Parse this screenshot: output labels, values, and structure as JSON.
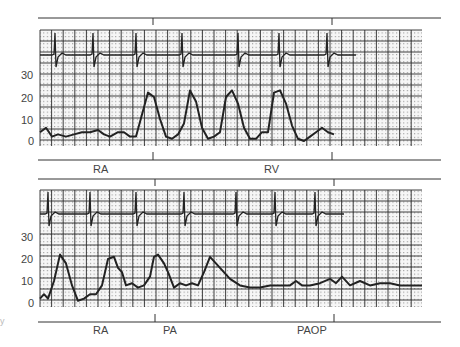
{
  "figure": {
    "stray_mark": "y",
    "grid_colors": {
      "major": "#1a1a1a",
      "minor": "#8a8a8a",
      "trace": "#222222",
      "paper": "#f4f4f4"
    }
  },
  "chart_data": [
    {
      "type": "line",
      "title": "",
      "panel": "top",
      "ylabel": "mmHg",
      "xlabel": "",
      "ylim": [
        0,
        40
      ],
      "yticks": [
        0,
        10,
        20,
        30
      ],
      "grid": true,
      "segment_labels": [
        "RA",
        "RV"
      ],
      "segment_boundaries_px": [
        153,
        332
      ],
      "series": [
        {
          "name": "ECG",
          "description": "ECG rhythm strip with QRS complexes",
          "qrs_x_px": [
            56,
            94,
            137,
            183,
            239,
            280,
            328
          ]
        },
        {
          "name": "Pressure",
          "description": "RA pressure waveform transitioning to RV pressure waveform",
          "x_px": [
            40,
            46,
            52,
            58,
            66,
            74,
            82,
            90,
            98,
            104,
            110,
            118,
            124,
            130,
            136,
            142,
            148,
            154,
            160,
            166,
            172,
            178,
            184,
            190,
            196,
            202,
            208,
            214,
            220,
            226,
            232,
            238,
            244,
            250,
            256,
            262,
            268,
            274,
            280,
            286,
            292,
            298,
            304,
            310,
            316,
            322,
            328,
            334
          ],
          "values": [
            4,
            6,
            2,
            3,
            2,
            3,
            4,
            4,
            5,
            3,
            2,
            4,
            4,
            2,
            2,
            12,
            22,
            20,
            10,
            2,
            1,
            3,
            8,
            23,
            18,
            6,
            1,
            2,
            4,
            20,
            23,
            17,
            6,
            1,
            1,
            4,
            4,
            22,
            23,
            17,
            7,
            1,
            0,
            2,
            4,
            6,
            4,
            3
          ]
        }
      ]
    },
    {
      "type": "line",
      "title": "",
      "panel": "bottom",
      "ylabel": "mmHg",
      "xlabel": "",
      "ylim": [
        0,
        40
      ],
      "yticks": [
        0,
        10,
        20,
        30
      ],
      "grid": true,
      "segment_labels": [
        "RA",
        "PA",
        "PAOP"
      ],
      "segment_boundaries_px": [
        155,
        334
      ],
      "series": [
        {
          "name": "ECG",
          "description": "ECG rhythm strip with QRS complexes",
          "qrs_x_px": [
            49,
            91,
            137,
            185,
            237,
            276,
            316
          ]
        },
        {
          "name": "Pressure",
          "description": "RV/PA pressure waveform transitioning to PAOP",
          "x_px": [
            40,
            44,
            48,
            54,
            60,
            66,
            72,
            78,
            84,
            90,
            96,
            102,
            108,
            114,
            118,
            122,
            126,
            132,
            138,
            144,
            150,
            154,
            158,
            164,
            168,
            174,
            180,
            186,
            192,
            198,
            204,
            210,
            220,
            230,
            240,
            250,
            260,
            270,
            280,
            290,
            296,
            302,
            310,
            320,
            330,
            336,
            342,
            350,
            360,
            370,
            380,
            390,
            400,
            410,
            422
          ],
          "values": [
            2,
            4,
            2,
            10,
            22,
            18,
            8,
            1,
            2,
            4,
            4,
            8,
            20,
            21,
            16,
            14,
            8,
            9,
            7,
            8,
            12,
            21,
            22,
            18,
            14,
            7,
            9,
            8,
            9,
            8,
            14,
            21,
            16,
            11,
            8,
            7,
            7,
            8,
            8,
            8,
            10,
            8,
            8,
            9,
            11,
            9,
            12,
            8,
            10,
            8,
            9,
            9,
            8,
            8,
            8
          ]
        }
      ]
    }
  ],
  "panels": {
    "top": {
      "y_ticks": [
        "30",
        "20",
        "10",
        "0"
      ],
      "labels": {
        "ra": "RA",
        "rv": "RV"
      }
    },
    "bottom": {
      "y_ticks": [
        "30",
        "20",
        "10",
        "0"
      ],
      "labels": {
        "ra": "RA",
        "pa": "PA",
        "paop": "PAOP"
      }
    }
  }
}
